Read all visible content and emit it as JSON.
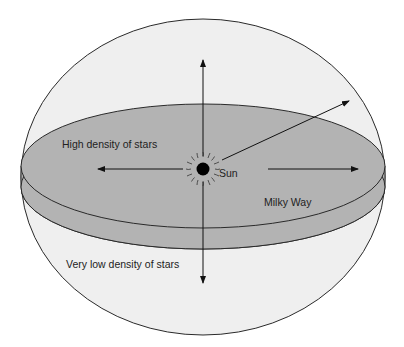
{
  "diagram": {
    "labels": {
      "high_density": "High density of stars",
      "sun": "Sun",
      "milky_way": "Milky Way",
      "low_density": "Very low density of stars"
    },
    "colors": {
      "sphere_fill": "#efefef",
      "disk_fill": "#b3b3b3",
      "stroke": "#2a2a2a",
      "sun": "#000000"
    }
  }
}
